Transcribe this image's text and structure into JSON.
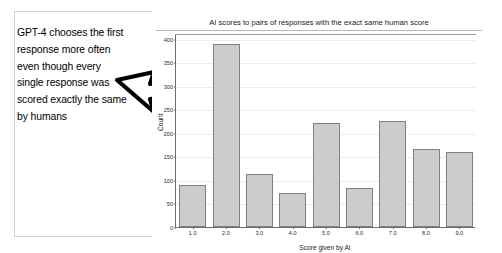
{
  "annotation": {
    "text": "GPT-4 chooses the first response more often even though every single response was scored exactly the same by humans",
    "arrow_icon": "arrow-right-icon"
  },
  "chart_data": {
    "type": "bar",
    "title": "AI scores to pairs of responses with the exact same human score",
    "xlabel": "Score given by AI",
    "ylabel": "Count",
    "categories": [
      "1.0",
      "2.0",
      "3.0",
      "4.0",
      "5.0",
      "6.0",
      "7.0",
      "8.0",
      "9.0"
    ],
    "values": [
      90,
      388,
      113,
      73,
      220,
      83,
      225,
      165,
      160
    ],
    "yticks": [
      "0",
      "50",
      "100",
      "150",
      "200",
      "250",
      "300",
      "350",
      "400"
    ],
    "ytick_values": [
      0,
      50,
      100,
      150,
      200,
      250,
      300,
      350,
      400
    ],
    "ylim": [
      0,
      410
    ],
    "grid": true,
    "legend": "none",
    "bar_color": "#cccccc",
    "bar_edge_color": "#808080"
  }
}
